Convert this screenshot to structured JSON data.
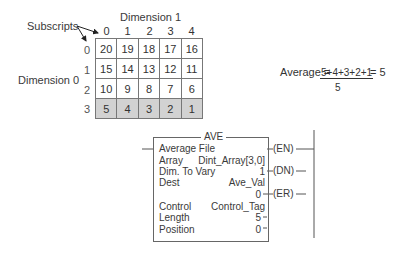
{
  "array_figure": {
    "subscripts_label": "Subscripts",
    "dimension1_label": "Dimension 1",
    "dimension0_label": "Dimension 0",
    "column_indices": [
      "0",
      "1",
      "2",
      "3",
      "4"
    ],
    "row_indices": [
      "0",
      "1",
      "2",
      "3"
    ],
    "rows": [
      [
        "20",
        "19",
        "18",
        "17",
        "16"
      ],
      [
        "15",
        "14",
        "13",
        "12",
        "11"
      ],
      [
        "10",
        "9",
        "8",
        "7",
        "6"
      ],
      [
        "5",
        "4",
        "3",
        "2",
        "1"
      ]
    ],
    "highlighted_row": 3,
    "highlight_color": "#d2d2d2"
  },
  "formula": {
    "lhs": "Average =",
    "numerator": "5+4+3+2+1",
    "denominator": "5",
    "result": "= 5"
  },
  "instruction_block": {
    "title": "AVE",
    "subtitle": "Average File",
    "params": [
      {
        "label": "Array",
        "value": "Dint_Array[3,0]"
      },
      {
        "label": "Dim. To Vary",
        "value": "1"
      },
      {
        "label": "Dest",
        "value": "Ave_Val"
      },
      {
        "label": "",
        "value": "0"
      },
      {
        "label": "Control",
        "value": "Control_Tag"
      },
      {
        "label": "Length",
        "value": "5"
      },
      {
        "label": "Position",
        "value": "0"
      }
    ],
    "outputs": [
      "(EN)",
      "(DN)",
      "(ER)"
    ]
  }
}
